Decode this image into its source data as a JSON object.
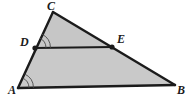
{
  "figure": {
    "kind": "geometry-diagram",
    "shape": "triangle-with-midsegment",
    "canvas": {
      "width": 187,
      "height": 98
    },
    "colors": {
      "fill": "#c9c9c9",
      "fill_upper": "#c6c6c6",
      "stroke": "#1b1b1b",
      "label": "#1b1b1b",
      "background": "#ffffff",
      "mark": "#4a4a4a"
    },
    "stroke_width": 2.4,
    "segment_stroke_width": 2.2
  },
  "points": {
    "A": {
      "label": "A",
      "x": 18,
      "y": 88,
      "label_x": 8,
      "label_y": 94,
      "dot": false
    },
    "B": {
      "label": "B",
      "x": 175,
      "y": 85,
      "label_x": 177,
      "label_y": 94,
      "dot": false
    },
    "C": {
      "label": "C",
      "x": 53,
      "y": 12,
      "label_x": 47,
      "label_y": 10,
      "dot": false
    },
    "D": {
      "label": "D",
      "x": 35,
      "y": 48,
      "label_x": 20,
      "label_y": 46,
      "dot": true
    },
    "E": {
      "label": "E",
      "x": 112,
      "y": 47,
      "label_x": 117,
      "label_y": 43,
      "dot": true
    }
  },
  "segments": [
    {
      "name": "side-AC",
      "from": "A",
      "to": "C"
    },
    {
      "name": "side-CB",
      "from": "C",
      "to": "B"
    },
    {
      "name": "side-AB",
      "from": "A",
      "to": "B"
    },
    {
      "name": "segment-DE",
      "from": "D",
      "to": "E"
    }
  ],
  "polygons": [
    {
      "name": "upper-triangle-CDE",
      "vertices": [
        "C",
        "D",
        "E"
      ]
    },
    {
      "name": "lower-trapezoid-DABE",
      "vertices": [
        "D",
        "A",
        "B",
        "E"
      ]
    }
  ],
  "angle_marks": [
    {
      "name": "angle-mark-D",
      "vertex": "D",
      "arcs": 2,
      "description": "double arc at angle CDE",
      "toward_a": "C",
      "toward_b": "E"
    },
    {
      "name": "angle-mark-A",
      "vertex": "A",
      "arcs": 2,
      "description": "double arc at angle DAB",
      "toward_a": "C",
      "toward_b": "B"
    }
  ],
  "labels": {
    "A": "A",
    "B": "B",
    "C": "C",
    "D": "D",
    "E": "E"
  }
}
